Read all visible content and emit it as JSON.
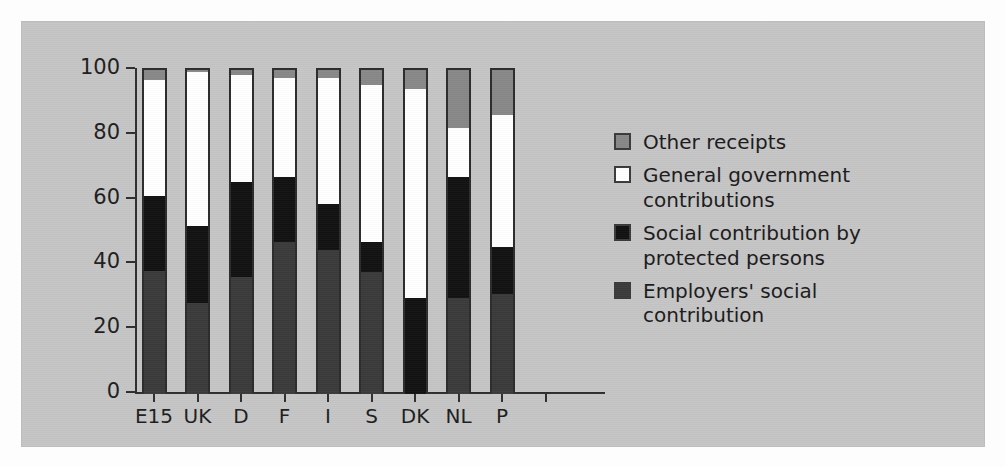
{
  "chart_data": {
    "type": "bar",
    "subtype": "stacked-bar-100",
    "title": "",
    "xlabel": "",
    "ylabel": "",
    "ylim": [
      0,
      100
    ],
    "yticks": [
      0,
      20,
      40,
      60,
      80,
      100
    ],
    "grid": false,
    "legend_position": "right",
    "categories": [
      "E15",
      "UK",
      "D",
      "F",
      "I",
      "S",
      "DK",
      "NL",
      "P"
    ],
    "series": [
      {
        "name": "Employers' social contribution",
        "color": "#3a3a3a",
        "values": [
          38,
          28,
          36,
          47,
          44.5,
          37.5,
          0,
          29.5,
          31
        ]
      },
      {
        "name": "Social contribution by protected persons",
        "color": "#111111",
        "values": [
          23,
          24,
          29.5,
          20,
          14,
          9.5,
          29.5,
          37.5,
          14.5
        ]
      },
      {
        "name": "General government contributions",
        "color": "#ffffff",
        "values": [
          36,
          47.5,
          33,
          30.5,
          39,
          48.5,
          64.5,
          15,
          40.5
        ]
      },
      {
        "name": "Other receipts",
        "color": "#888888",
        "values": [
          3,
          0.5,
          1.5,
          2.5,
          2.5,
          4.5,
          6,
          18,
          14
        ]
      }
    ],
    "cumulative_tops": {
      "E15": [
        38,
        61,
        97,
        100
      ],
      "UK": [
        28,
        52,
        99.5,
        100
      ],
      "D": [
        36,
        65.5,
        98.5,
        100
      ],
      "F": [
        47,
        67,
        97.5,
        100
      ],
      "I": [
        44.5,
        58.5,
        97.5,
        100
      ],
      "S": [
        37.5,
        47,
        95.5,
        100
      ],
      "DK": [
        0,
        29.5,
        94,
        100
      ],
      "NL": [
        29.5,
        67,
        82,
        100
      ],
      "P": [
        31,
        45.5,
        86,
        100
      ]
    }
  },
  "axis": {
    "y_tick_labels": [
      "100",
      "80",
      "60",
      "40",
      "20",
      "0"
    ],
    "x_tick_labels": [
      "E15",
      "UK",
      "D",
      "F",
      "I",
      "S",
      "DK",
      "NL",
      "P"
    ]
  },
  "legend": {
    "items": [
      {
        "label": "Other receipts",
        "color": "#888888"
      },
      {
        "label": "General government contributions",
        "color": "#ffffff"
      },
      {
        "label": "Social contribution by protected persons",
        "color": "#111111"
      },
      {
        "label": "Employers' social contribution",
        "color": "#3a3a3a"
      }
    ]
  },
  "colors": {
    "panel_background": "#c5c5c5",
    "page_background": "#fdfdfd",
    "axis": "#2e2e2e",
    "text": "#1a1a1a",
    "other_receipts": "#888888",
    "general_government": "#ffffff",
    "social_contribution_protected": "#111111",
    "employers_social": "#3a3a3a"
  }
}
